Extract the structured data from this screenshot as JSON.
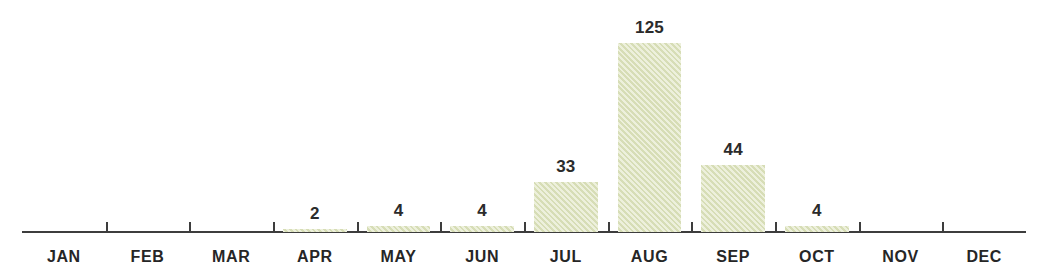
{
  "chart_data": {
    "type": "bar",
    "title": "",
    "subtitle": "",
    "xlabel": "",
    "ylabel": "",
    "categories": [
      "JAN",
      "FEB",
      "MAR",
      "APR",
      "MAY",
      "JUN",
      "JUL",
      "AUG",
      "SEP",
      "OCT",
      "NOV",
      "DEC"
    ],
    "values": [
      0,
      0,
      0,
      2,
      4,
      4,
      33,
      125,
      44,
      4,
      0,
      0
    ],
    "data_labels": [
      "",
      "",
      "",
      "2",
      "4",
      "4",
      "33",
      "125",
      "44",
      "4",
      "",
      ""
    ],
    "ylim": [
      0,
      125
    ],
    "grid": false,
    "legend": false,
    "legend_position": "none",
    "axis": {
      "baseline_visible": true,
      "ticks_at_category_boundaries": true,
      "tick_count": 11,
      "y_axis_visible": false,
      "y_tick_labels": []
    },
    "colors": {
      "bar_fill": "#dfe4c0",
      "bar_hatch": "#c7d0a3",
      "axis": "#3d3d3d",
      "label_text": "#262626",
      "value_text": "#2b2b2b",
      "background": "#ffffff"
    }
  }
}
